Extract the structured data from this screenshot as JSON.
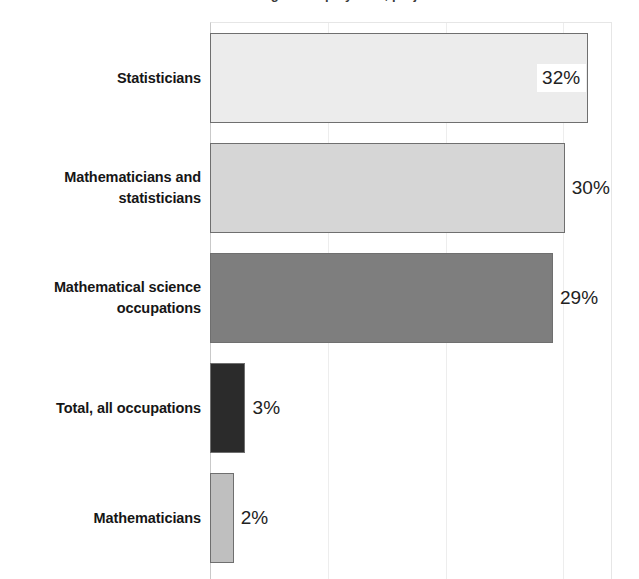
{
  "chart_data": {
    "type": "bar",
    "orientation": "horizontal",
    "title": "Percent change in employment, projected",
    "xlabel": "",
    "ylabel": "",
    "xlim": [
      0,
      34
    ],
    "grid": false,
    "legend": "none",
    "value_suffix": "%",
    "categories": [
      "Statisticians",
      "Mathematicians and statisticians",
      "Mathematical science occupations",
      "Total, all occupations",
      "Mathematicians"
    ],
    "values": [
      32,
      30,
      29,
      3,
      2
    ],
    "value_labels": [
      "32%",
      "30%",
      "29%",
      "3%",
      "2%"
    ],
    "bar_colors": [
      "#ECECEC",
      "#D6D6D6",
      "#7E7E7E",
      "#2B2B2B",
      "#BFBFBF"
    ],
    "bar_border_color": "#6F6F6F",
    "label_placement": [
      "inside",
      "outside",
      "outside",
      "outside",
      "outside"
    ]
  },
  "axis": {
    "line_color": "#C9C9C9",
    "plot_border_color": "#E6E6E6"
  },
  "category_lines": [
    [
      "Statisticians"
    ],
    [
      "Mathematicians and",
      "statisticians"
    ],
    [
      "Mathematical science",
      "occupations"
    ],
    [
      "Total, all occupations"
    ],
    [
      "Mathematicians"
    ]
  ]
}
